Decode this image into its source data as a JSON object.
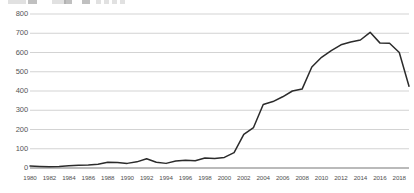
{
  "top_strip": {
    "description": "truncated toolbar row cut off at top edge",
    "chips": [
      {
        "x": 8,
        "w": 18,
        "tone": "light"
      },
      {
        "x": 28,
        "w": 9,
        "tone": "dark"
      },
      {
        "x": 52,
        "w": 14,
        "tone": "light"
      },
      {
        "x": 64,
        "w": 8,
        "tone": "dark"
      },
      {
        "x": 82,
        "w": 8,
        "tone": "dark"
      },
      {
        "x": 96,
        "w": 5,
        "tone": "light"
      },
      {
        "x": 104,
        "w": 5,
        "tone": "light"
      },
      {
        "x": 112,
        "w": 5,
        "tone": "light"
      },
      {
        "x": 120,
        "w": 5,
        "tone": "light"
      }
    ]
  },
  "colors": {
    "line": "#2b2b2b",
    "gridline": "#c8c8c8",
    "axis": "#555555",
    "tick_text": "#4f4f4f",
    "background": "#ffffff"
  },
  "chart_data": {
    "type": "line",
    "title": "",
    "subtitle": "",
    "xlabel": "",
    "ylabel": "",
    "xlim": [
      1980,
      2019
    ],
    "ylim": [
      0,
      800
    ],
    "grid": true,
    "legend": "none",
    "ytick_labels": [
      "0",
      "100",
      "200",
      "300",
      "400",
      "500",
      "600",
      "700",
      "800"
    ],
    "yticks": [
      0,
      100,
      200,
      300,
      400,
      500,
      600,
      700,
      800
    ],
    "xtick_labels": [
      "1980",
      "1982",
      "1984",
      "1986",
      "1988",
      "1990",
      "1992",
      "1994",
      "1996",
      "1998",
      "2000",
      "2002",
      "2004",
      "2006",
      "2008",
      "2010",
      "2012",
      "2014",
      "2016",
      "2018"
    ],
    "xticks": [
      1980,
      1982,
      1984,
      1986,
      1988,
      1990,
      1992,
      1994,
      1996,
      1998,
      2000,
      2002,
      2004,
      2006,
      2008,
      2010,
      2012,
      2014,
      2016,
      2018
    ],
    "series": [
      {
        "name": "series-1",
        "x": [
          1980,
          1981,
          1982,
          1983,
          1984,
          1985,
          1986,
          1987,
          1988,
          1989,
          1990,
          1991,
          1992,
          1993,
          1994,
          1995,
          1996,
          1997,
          1998,
          1999,
          2000,
          2001,
          2002,
          2003,
          2004,
          2005,
          2006,
          2007,
          2008,
          2009,
          2010,
          2011,
          2012,
          2013,
          2014,
          2015,
          2016,
          2017,
          2018,
          2019
        ],
        "values": [
          10,
          8,
          6,
          8,
          12,
          14,
          16,
          20,
          30,
          28,
          24,
          32,
          48,
          30,
          24,
          36,
          40,
          38,
          52,
          50,
          55,
          80,
          175,
          210,
          330,
          345,
          370,
          400,
          410,
          525,
          575,
          610,
          640,
          655,
          665,
          705,
          650,
          648,
          600,
          425
        ]
      }
    ]
  }
}
